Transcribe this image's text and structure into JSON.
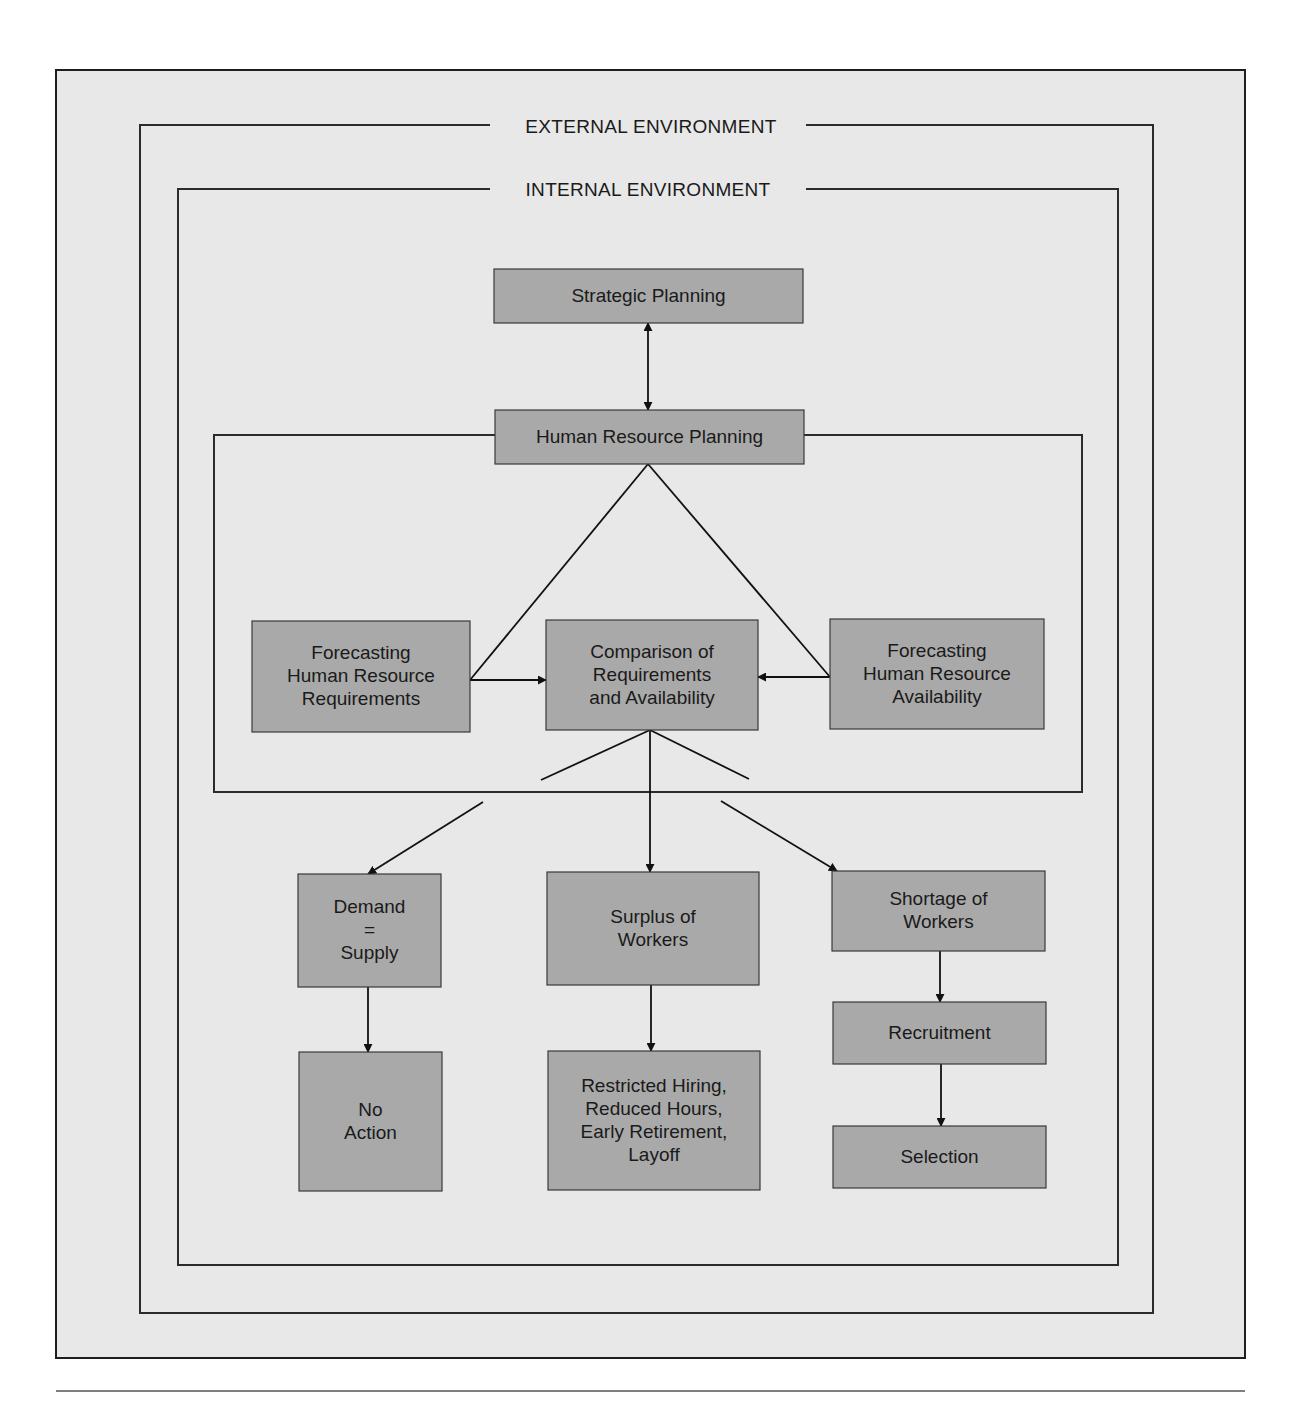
{
  "colors": {
    "page_background": "#ffffff",
    "panel_background": "#e8e8e8",
    "node_fill": "#a9a9a9",
    "line": "#111111"
  },
  "frames": {
    "panel": {
      "x": 56,
      "y": 70,
      "w": 1189,
      "h": 1288
    },
    "external": {
      "x": 140,
      "y": 125,
      "w": 1013,
      "h": 1188,
      "label": "EXTERNAL ENVIRONMENT",
      "label_x": 651,
      "label_y": 133,
      "gap": [
        490,
        806
      ]
    },
    "internal": {
      "x": 178,
      "y": 189,
      "w": 940,
      "h": 1076,
      "label": "INTERNAL ENVIRONMENT",
      "label_x": 648,
      "label_y": 196,
      "gap": [
        490,
        806
      ]
    },
    "hr_box": {
      "x": 214,
      "y": 435,
      "w": 868,
      "h": 357
    },
    "footer_rule_y": 1391
  },
  "nodes": [
    {
      "id": "strategic-planning",
      "x": 494,
      "y": 269,
      "w": 309,
      "h": 54,
      "lines": [
        "Strategic Planning"
      ]
    },
    {
      "id": "human-resource-planning",
      "x": 495,
      "y": 410,
      "w": 309,
      "h": 54,
      "lines": [
        "Human Resource Planning"
      ]
    },
    {
      "id": "forecasting-requirements",
      "x": 252,
      "y": 621,
      "w": 218,
      "h": 111,
      "lines": [
        "Forecasting",
        "Human Resource",
        "Requirements"
      ]
    },
    {
      "id": "comparison",
      "x": 546,
      "y": 620,
      "w": 212,
      "h": 110,
      "lines": [
        "Comparison of",
        "Requirements",
        "and Availability"
      ]
    },
    {
      "id": "forecasting-availability",
      "x": 830,
      "y": 619,
      "w": 214,
      "h": 110,
      "lines": [
        "Forecasting",
        "Human Resource",
        "Availability"
      ]
    },
    {
      "id": "demand-equals-supply",
      "x": 298,
      "y": 874,
      "w": 143,
      "h": 113,
      "lines": [
        "Demand",
        "=",
        "Supply"
      ]
    },
    {
      "id": "surplus-of-workers",
      "x": 547,
      "y": 872,
      "w": 212,
      "h": 113,
      "lines": [
        "Surplus of",
        "Workers"
      ]
    },
    {
      "id": "shortage-of-workers",
      "x": 832,
      "y": 871,
      "w": 213,
      "h": 80,
      "lines": [
        "Shortage of",
        "Workers"
      ]
    },
    {
      "id": "no-action",
      "x": 299,
      "y": 1052,
      "w": 143,
      "h": 139,
      "lines": [
        "No",
        "Action"
      ]
    },
    {
      "id": "restricted-hiring",
      "x": 548,
      "y": 1051,
      "w": 212,
      "h": 139,
      "lines": [
        "Restricted Hiring,",
        "Reduced Hours,",
        "Early Retirement,",
        "Layoff"
      ]
    },
    {
      "id": "recruitment",
      "x": 833,
      "y": 1002,
      "w": 213,
      "h": 62,
      "lines": [
        "Recruitment"
      ]
    },
    {
      "id": "selection",
      "x": 833,
      "y": 1126,
      "w": 213,
      "h": 62,
      "lines": [
        "Selection"
      ]
    }
  ],
  "connectors": [
    {
      "id": "strategic-hr-bidirectional",
      "points": [
        [
          648,
          323
        ],
        [
          648,
          410
        ]
      ],
      "arrow_start": true,
      "arrow_end": true
    },
    {
      "id": "hr-to-req-line",
      "points": [
        [
          648,
          464
        ],
        [
          470,
          680
        ]
      ],
      "arrow_start": false,
      "arrow_end": false
    },
    {
      "id": "hr-to-avail-line",
      "points": [
        [
          648,
          464
        ],
        [
          830,
          677
        ]
      ],
      "arrow_start": false,
      "arrow_end": false
    },
    {
      "id": "req-to-comparison",
      "points": [
        [
          470,
          680
        ],
        [
          546,
          680
        ]
      ],
      "arrow_start": false,
      "arrow_end": true
    },
    {
      "id": "avail-to-comparison",
      "points": [
        [
          830,
          677
        ],
        [
          758,
          677
        ]
      ],
      "arrow_start": false,
      "arrow_end": true
    },
    {
      "id": "comparison-branch-left",
      "points": [
        [
          650,
          730
        ],
        [
          541,
          780
        ]
      ],
      "arrow_start": false,
      "arrow_end": false
    },
    {
      "id": "comparison-branch-right",
      "points": [
        [
          650,
          730
        ],
        [
          749,
          779
        ]
      ],
      "arrow_start": false,
      "arrow_end": false
    },
    {
      "id": "to-demand-supply",
      "points": [
        [
          483,
          802
        ],
        [
          368,
          874
        ]
      ],
      "arrow_start": false,
      "arrow_end": true
    },
    {
      "id": "to-surplus",
      "points": [
        [
          650,
          730
        ],
        [
          650,
          872
        ]
      ],
      "arrow_start": false,
      "arrow_end": true
    },
    {
      "id": "to-shortage",
      "points": [
        [
          721,
          801
        ],
        [
          837,
          871
        ]
      ],
      "arrow_start": false,
      "arrow_end": true
    },
    {
      "id": "demand-to-no-action",
      "points": [
        [
          368,
          987
        ],
        [
          368,
          1052
        ]
      ],
      "arrow_start": false,
      "arrow_end": true
    },
    {
      "id": "surplus-to-restricted",
      "points": [
        [
          651,
          985
        ],
        [
          651,
          1051
        ]
      ],
      "arrow_start": false,
      "arrow_end": true
    },
    {
      "id": "shortage-to-recruitment",
      "points": [
        [
          940,
          951
        ],
        [
          940,
          1002
        ]
      ],
      "arrow_start": false,
      "arrow_end": true
    },
    {
      "id": "recruitment-to-selection",
      "points": [
        [
          941,
          1064
        ],
        [
          941,
          1126
        ]
      ],
      "arrow_start": false,
      "arrow_end": true
    }
  ]
}
